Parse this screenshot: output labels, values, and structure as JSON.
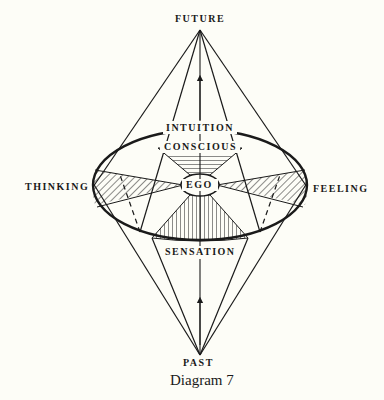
{
  "diagram": {
    "labels": {
      "top": "FUTURE",
      "bottom": "PAST",
      "left": "THINKING",
      "right": "FEELING",
      "upper_function": "INTUITION",
      "upper_zone": "CONSCIOUS",
      "center": "EGO",
      "lower_function": "SENSATION"
    },
    "caption": "Diagram 7",
    "colors": {
      "background": "#fdfdf7",
      "ink": "#1a1a1a"
    }
  }
}
